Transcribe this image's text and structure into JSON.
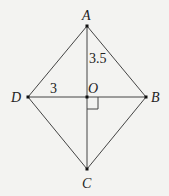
{
  "diagram": {
    "type": "rhombus",
    "points": {
      "A": {
        "label": "A",
        "x": 87,
        "y": 26
      },
      "B": {
        "label": "B",
        "x": 146,
        "y": 97
      },
      "C": {
        "label": "C",
        "x": 87,
        "y": 169
      },
      "D": {
        "label": "D",
        "x": 28,
        "y": 97
      },
      "O": {
        "label": "O",
        "x": 87,
        "y": 97
      }
    },
    "measurements": {
      "AO": "3.5",
      "DO": "3"
    },
    "right_angle_at": "O"
  }
}
